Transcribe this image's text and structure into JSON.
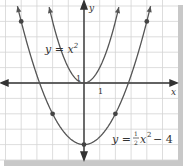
{
  "figure": {
    "type": "coordinate-graph",
    "axes": {
      "x_label": "x",
      "y_label": "y",
      "x_tick_label": "1",
      "y_tick_label": "1"
    },
    "curves": [
      {
        "name": "parent-parabola",
        "equation_label": "y = x",
        "equation_exponent": "2",
        "function": "x^2",
        "color": "#555555"
      },
      {
        "name": "transformed-parabola",
        "equation_label_prefix": "y =",
        "equation_fraction_num": "1",
        "equation_fraction_den": "2",
        "equation_var": "x",
        "equation_exponent": "2",
        "equation_label_suffix": "− 4",
        "function": "0.5*x^2 - 4",
        "color": "#555555",
        "points": [
          [
            -4,
            4
          ],
          [
            -2,
            -2
          ],
          [
            0,
            -4
          ],
          [
            2,
            -2
          ],
          [
            4,
            4
          ]
        ]
      }
    ],
    "colors": {
      "grid": "#d4d4d4",
      "axis": "#333333",
      "curve": "#555555",
      "point": "#444444",
      "shadow": "#c8c8c8",
      "background": "#ffffff"
    }
  }
}
